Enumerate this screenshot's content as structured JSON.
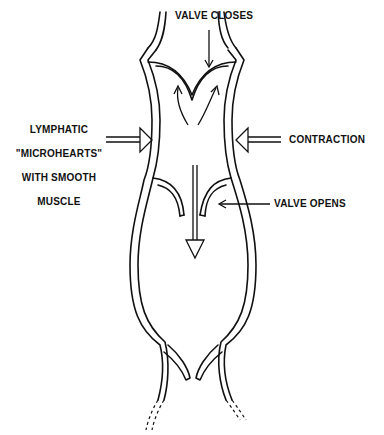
{
  "diagram": {
    "labels": {
      "valve_closes": "VALVE CLOSES",
      "microhearts_line1": "LYMPHATIC",
      "microhearts_line2": "\"MICROHEARTS\"",
      "microhearts_line3": "WITH SMOOTH",
      "microhearts_line4": "MUSCLE",
      "contraction": "CONTRACTION",
      "valve_opens": "VALVE OPENS"
    },
    "colors": {
      "stroke": "#111111",
      "background": "#ffffff"
    }
  }
}
